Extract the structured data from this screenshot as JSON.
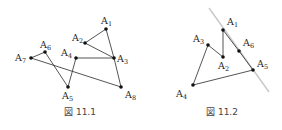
{
  "figures": [
    {
      "id": "fig1",
      "caption": "図 11.1",
      "caption_pos": [
        80,
        115
      ],
      "points": [
        {
          "name": "A",
          "sub": "1",
          "x": 106,
          "y": 29,
          "lx": 101,
          "ly": 24
        },
        {
          "name": "A",
          "sub": "2",
          "x": 85,
          "y": 43,
          "lx": 72,
          "ly": 41
        },
        {
          "name": "A",
          "sub": "3",
          "x": 114,
          "y": 58,
          "lx": 117,
          "ly": 62
        },
        {
          "name": "A",
          "sub": "4",
          "x": 76,
          "y": 58,
          "lx": 61,
          "ly": 56
        },
        {
          "name": "A",
          "sub": "5",
          "x": 68,
          "y": 87,
          "lx": 62,
          "ly": 99
        },
        {
          "name": "A",
          "sub": "6",
          "x": 45,
          "y": 52,
          "lx": 40,
          "ly": 48
        },
        {
          "name": "A",
          "sub": "7",
          "x": 31,
          "y": 58,
          "lx": 15,
          "ly": 61
        },
        {
          "name": "A",
          "sub": "8",
          "x": 121,
          "y": 87,
          "lx": 125,
          "ly": 98
        }
      ],
      "segments": [
        [
          0,
          1
        ],
        [
          1,
          2
        ],
        [
          0,
          2
        ],
        [
          3,
          2
        ],
        [
          3,
          4
        ],
        [
          4,
          5
        ],
        [
          5,
          6
        ],
        [
          6,
          7
        ],
        [
          2,
          7
        ]
      ],
      "guide_line": null
    },
    {
      "id": "fig2",
      "caption": "図 11.2",
      "caption_pos": [
        222,
        115
      ],
      "points": [
        {
          "name": "A",
          "sub": "1",
          "x": 223,
          "y": 30,
          "lx": 227,
          "ly": 25
        },
        {
          "name": "A",
          "sub": "2",
          "x": 223,
          "y": 57,
          "lx": 218,
          "ly": 69
        },
        {
          "name": "A",
          "sub": "3",
          "x": 208,
          "y": 45,
          "lx": 193,
          "ly": 42
        },
        {
          "name": "A",
          "sub": "4",
          "x": 193,
          "y": 85,
          "lx": 176,
          "ly": 97
        },
        {
          "name": "A",
          "sub": "5",
          "x": 253,
          "y": 70,
          "lx": 257,
          "ly": 67
        },
        {
          "name": "A",
          "sub": "6",
          "x": 239,
          "y": 51,
          "lx": 243,
          "ly": 46
        }
      ],
      "segments": [
        [
          0,
          1
        ],
        [
          1,
          2
        ],
        [
          2,
          3
        ],
        [
          3,
          4
        ],
        [
          4,
          5
        ],
        [
          5,
          0
        ]
      ],
      "guide_line": {
        "x1": 209,
        "y1": 8,
        "x2": 269,
        "y2": 92,
        "color": "#c8c8c8"
      }
    }
  ],
  "colors": {
    "stroke": "#2a2a2a",
    "point": "#111111",
    "text": "#222222",
    "caption": "#444444"
  }
}
